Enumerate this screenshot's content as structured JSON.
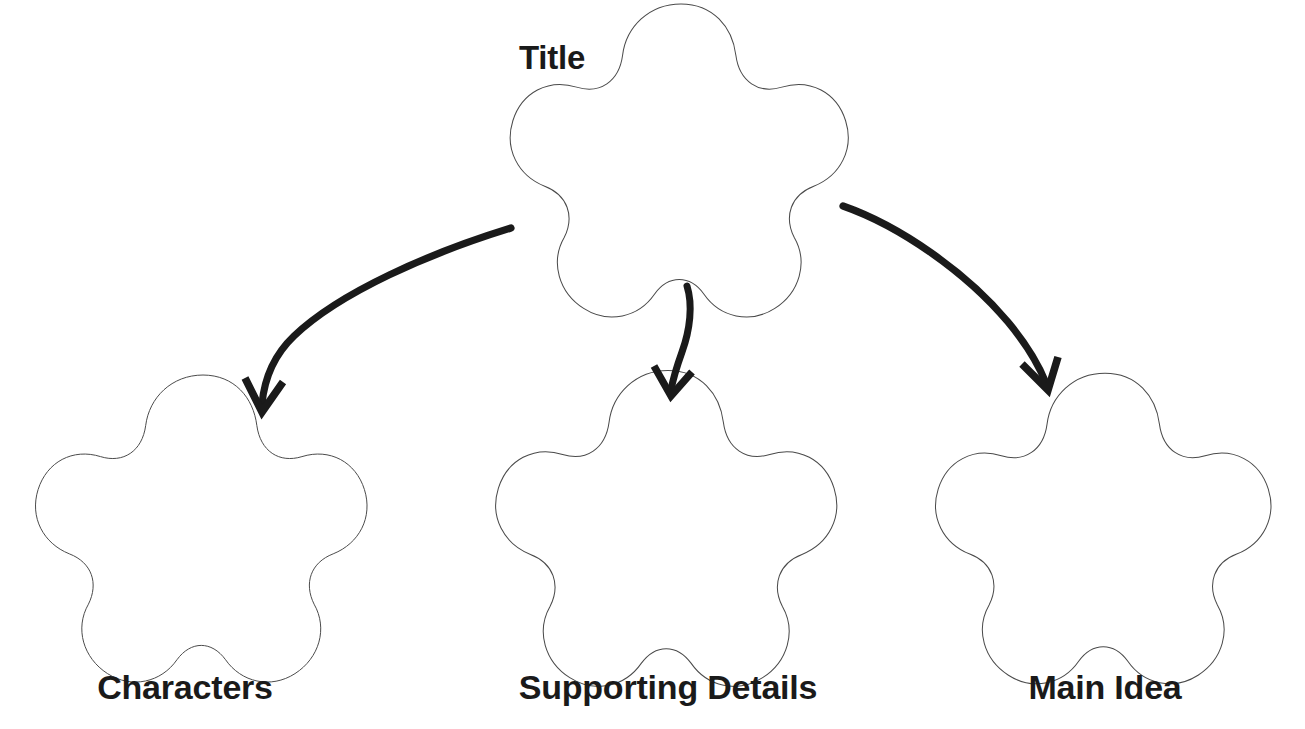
{
  "worksheet": {
    "type": "graphic-organizer",
    "shape": "five-lobed-cloud",
    "background_color": "#ffffff",
    "outline_color": "#4a4a4a",
    "arrow_color": "#1a1a1a",
    "text_color": "#1a1a1a"
  },
  "title_node": {
    "label": "Title",
    "shape_name": "cloud-shape-title",
    "center_x": 681,
    "center_y": 165,
    "radius": 176
  },
  "branches": [
    {
      "label": "Characters",
      "shape_name": "cloud-shape-characters",
      "center_x": 203,
      "center_y": 533,
      "radius": 173
    },
    {
      "label": "Supporting Details",
      "shape_name": "cloud-shape-supporting-details",
      "center_x": 668,
      "center_y": 533,
      "radius": 178
    },
    {
      "label": "Main Idea",
      "shape_name": "cloud-shape-main-idea",
      "center_x": 1105,
      "center_y": 533,
      "radius": 175
    }
  ],
  "arrows": [
    {
      "name": "arrow-title-to-characters",
      "from": "Title",
      "to": "Characters",
      "start_x": 510,
      "start_y": 228,
      "end_x": 262,
      "end_y": 412,
      "direction": "down-left"
    },
    {
      "name": "arrow-title-to-supporting-details",
      "from": "Title",
      "to": "Supporting Details",
      "start_x": 686,
      "start_y": 286,
      "end_x": 671,
      "end_y": 396,
      "direction": "down"
    },
    {
      "name": "arrow-title-to-main-idea",
      "from": "Title",
      "to": "Main Idea",
      "start_x": 843,
      "start_y": 205,
      "end_x": 1046,
      "end_y": 390,
      "direction": "down-right"
    }
  ]
}
